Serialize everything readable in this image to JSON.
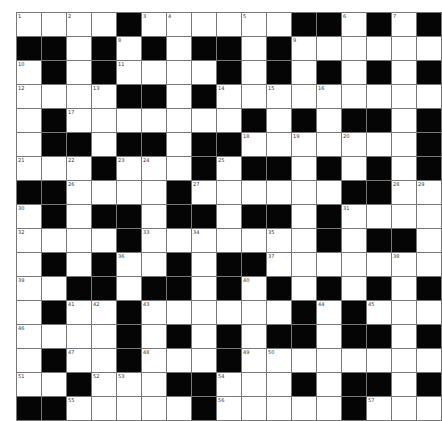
{
  "puzzle": {
    "rows": 17,
    "cols": 17,
    "colors": {
      "block": "#050505",
      "cell": "#ffffff",
      "grid_line": "#777777"
    },
    "grid": [
      "WWWWBWWWWWWBBWBWB",
      "BBWBWBWBBWBWWWWWW",
      "WBWBWWWWBWBWBWBWB",
      "WWWWBBWBWWWWWWWWW",
      "WBWWWWWWWBWBWBBWB",
      "WBBWBBWBBWWWWWWWB",
      "WWWBWWWBWBBWBWBWB",
      "BBWWWWBWWWWWWBBWW",
      "WBWBBWBBWBBWBWWWW",
      "WWWWBWWWWWWWBWBBW",
      "WBWBWWBWBBWWWWWWW",
      "WWBBWBBWBWBWBWBWB",
      "WBWWBWWWWWWBWBWWW",
      "WWWWBWBWBWBBWBBWB",
      "WBWWBWWWBWWWWWWWW",
      "WWBWWWBBWWWBWBBWB",
      "BBWWWWWBWWWWWBWWW"
    ],
    "numbers": [
      {
        "r": 0,
        "c": 0,
        "n": "1"
      },
      {
        "r": 0,
        "c": 2,
        "n": "2"
      },
      {
        "r": 0,
        "c": 5,
        "n": "3"
      },
      {
        "r": 0,
        "c": 6,
        "n": "4"
      },
      {
        "r": 0,
        "c": 9,
        "n": "5"
      },
      {
        "r": 0,
        "c": 13,
        "n": "6"
      },
      {
        "r": 0,
        "c": 15,
        "n": "7"
      },
      {
        "r": 1,
        "c": 4,
        "n": "8"
      },
      {
        "r": 1,
        "c": 11,
        "n": "9"
      },
      {
        "r": 2,
        "c": 0,
        "n": "10"
      },
      {
        "r": 2,
        "c": 4,
        "n": "11"
      },
      {
        "r": 3,
        "c": 0,
        "n": "12"
      },
      {
        "r": 3,
        "c": 3,
        "n": "13"
      },
      {
        "r": 3,
        "c": 8,
        "n": "14"
      },
      {
        "r": 3,
        "c": 10,
        "n": "15"
      },
      {
        "r": 3,
        "c": 12,
        "n": "16"
      },
      {
        "r": 4,
        "c": 2,
        "n": "17"
      },
      {
        "r": 5,
        "c": 9,
        "n": "18"
      },
      {
        "r": 5,
        "c": 11,
        "n": "19"
      },
      {
        "r": 5,
        "c": 13,
        "n": "20"
      },
      {
        "r": 6,
        "c": 0,
        "n": "21"
      },
      {
        "r": 6,
        "c": 2,
        "n": "22"
      },
      {
        "r": 6,
        "c": 4,
        "n": "23"
      },
      {
        "r": 6,
        "c": 5,
        "n": "24"
      },
      {
        "r": 6,
        "c": 8,
        "n": "25"
      },
      {
        "r": 7,
        "c": 2,
        "n": "26"
      },
      {
        "r": 7,
        "c": 7,
        "n": "27"
      },
      {
        "r": 7,
        "c": 15,
        "n": "28"
      },
      {
        "r": 7,
        "c": 16,
        "n": "29"
      },
      {
        "r": 8,
        "c": 0,
        "n": "30"
      },
      {
        "r": 8,
        "c": 13,
        "n": "31"
      },
      {
        "r": 9,
        "c": 0,
        "n": "32"
      },
      {
        "r": 9,
        "c": 5,
        "n": "33"
      },
      {
        "r": 9,
        "c": 7,
        "n": "34"
      },
      {
        "r": 9,
        "c": 10,
        "n": "35"
      },
      {
        "r": 10,
        "c": 4,
        "n": "36"
      },
      {
        "r": 10,
        "c": 10,
        "n": "37"
      },
      {
        "r": 10,
        "c": 15,
        "n": "38"
      },
      {
        "r": 11,
        "c": 0,
        "n": "39"
      },
      {
        "r": 11,
        "c": 9,
        "n": "40"
      },
      {
        "r": 12,
        "c": 2,
        "n": "41"
      },
      {
        "r": 12,
        "c": 3,
        "n": "42"
      },
      {
        "r": 12,
        "c": 5,
        "n": "43"
      },
      {
        "r": 12,
        "c": 12,
        "n": "44"
      },
      {
        "r": 12,
        "c": 14,
        "n": "45"
      },
      {
        "r": 13,
        "c": 0,
        "n": "46"
      },
      {
        "r": 14,
        "c": 2,
        "n": "47"
      },
      {
        "r": 14,
        "c": 5,
        "n": "48"
      },
      {
        "r": 14,
        "c": 9,
        "n": "49"
      },
      {
        "r": 14,
        "c": 10,
        "n": "50"
      },
      {
        "r": 15,
        "c": 0,
        "n": "51"
      },
      {
        "r": 15,
        "c": 3,
        "n": "52"
      },
      {
        "r": 15,
        "c": 4,
        "n": "53"
      },
      {
        "r": 15,
        "c": 8,
        "n": "54"
      },
      {
        "r": 16,
        "c": 2,
        "n": "55"
      },
      {
        "r": 16,
        "c": 8,
        "n": "56"
      },
      {
        "r": 16,
        "c": 14,
        "n": "57"
      }
    ]
  }
}
